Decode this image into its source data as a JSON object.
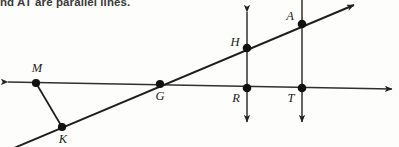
{
  "problem": {
    "text": "nd AT are parallel lines."
  },
  "figure": {
    "background": "#fdfdfc",
    "stroke_color": "#222222",
    "point_color": "#111111",
    "labels": {
      "M": "M",
      "K": "K",
      "G": "G",
      "H": "H",
      "R": "R",
      "T": "T",
      "A": "A"
    },
    "points": [
      {
        "name": "M",
        "x": 36,
        "y": 83,
        "label_x": 37,
        "label_y": 72
      },
      {
        "name": "K",
        "x": 62,
        "y": 127,
        "label_x": 63,
        "label_y": 142
      },
      {
        "name": "G",
        "x": 160,
        "y": 84,
        "label_x": 160,
        "label_y": 99
      },
      {
        "name": "H",
        "x": 247,
        "y": 48,
        "label_x": 235,
        "label_y": 45
      },
      {
        "name": "R",
        "x": 247,
        "y": 88,
        "label_x": 236,
        "label_y": 101
      },
      {
        "name": "T",
        "x": 302,
        "y": 88,
        "label_x": 291,
        "label_y": 101
      },
      {
        "name": "A",
        "x": 302,
        "y": 24,
        "label_x": 290,
        "label_y": 19
      }
    ],
    "lines": [
      {
        "name": "line-MG-RT-horizontal",
        "x1": 8,
        "y1": 82,
        "x2": 392,
        "y2": 89,
        "arrow_start": true,
        "arrow_end": true
      },
      {
        "name": "line-K-G-H-A-diagonal",
        "x1": 14,
        "y1": 147,
        "x2": 354,
        "y2": 5,
        "arrow_start": false,
        "arrow_end": true
      },
      {
        "name": "line-HR-vertical",
        "x1": 247,
        "y1": 12,
        "x2": 247,
        "y2": 122,
        "arrow_start": true,
        "arrow_end": true
      },
      {
        "name": "line-AT-vertical",
        "x1": 302,
        "y1": 0,
        "x2": 302,
        "y2": 122,
        "arrow_start": false,
        "arrow_end": true
      },
      {
        "name": "segment-M-K",
        "x1": 36,
        "y1": 83,
        "x2": 62,
        "y2": 127,
        "arrow_start": false,
        "arrow_end": false
      }
    ]
  }
}
